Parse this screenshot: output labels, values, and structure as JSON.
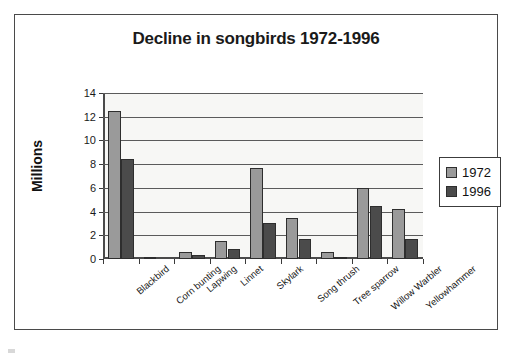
{
  "chart_data": {
    "type": "bar",
    "title": "Decline in songbirds 1972-1996",
    "xlabel": "",
    "ylabel": "Millions",
    "ylim": [
      0,
      14
    ],
    "yticks": [
      0,
      2,
      4,
      6,
      8,
      10,
      12,
      14
    ],
    "grid": true,
    "legend_position": "right",
    "categories": [
      "Blackbird",
      "Corn bunting",
      "Lapwing",
      "Linnet",
      "Skylark",
      "Song thrush",
      "Tree sparrow",
      "Willow Warbler",
      "Yellowhammer"
    ],
    "series": [
      {
        "name": "1972",
        "color": "#9a9a9a",
        "values": [
          12.5,
          0.15,
          0.6,
          1.5,
          7.65,
          3.5,
          0.55,
          6.0,
          4.25
        ]
      },
      {
        "name": "1996",
        "color": "#4b4b4b",
        "values": [
          8.4,
          0.0,
          0.3,
          0.85,
          3.0,
          1.65,
          0.05,
          4.5,
          1.65
        ]
      }
    ]
  },
  "legend": {
    "entries": [
      {
        "label": "1972",
        "swatch": "legend-swatch-1972"
      },
      {
        "label": "1996",
        "swatch": "legend-swatch-1996"
      }
    ]
  }
}
